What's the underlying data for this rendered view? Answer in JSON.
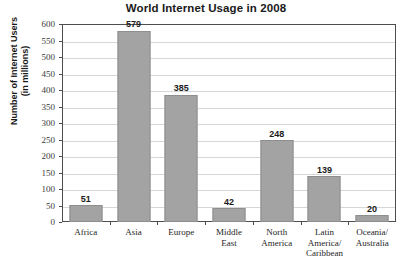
{
  "chart_data": {
    "type": "bar",
    "title": "World Internet Usage in 2008",
    "xlabel": "",
    "ylabel": "Number of Internet Users\n(in millions)",
    "ylabel_line1": "Number of Internet Users",
    "ylabel_line2": "(in millions)",
    "categories": [
      "Africa",
      "Asia",
      "Europe",
      "Middle East",
      "North America",
      "Latin America/ Caribbean",
      "Oceania/ Australia"
    ],
    "category_lines": [
      [
        "Africa"
      ],
      [
        "Asia"
      ],
      [
        "Europe"
      ],
      [
        "Middle",
        "East"
      ],
      [
        "North",
        "America"
      ],
      [
        "Latin",
        "America/",
        "Caribbean"
      ],
      [
        "Oceania/",
        "Australia"
      ]
    ],
    "values": [
      51,
      579,
      385,
      42,
      248,
      139,
      20
    ],
    "value_labels": [
      "51",
      "579",
      "385",
      "42",
      "248",
      "139",
      "20"
    ],
    "ylim": [
      0,
      600
    ],
    "ytick_step": 50,
    "ytick_labels": [
      "600",
      "550",
      "500",
      "450",
      "400",
      "350",
      "300",
      "250",
      "200",
      "150",
      "100",
      "50",
      "0"
    ],
    "ytick_values": [
      600,
      550,
      500,
      450,
      400,
      350,
      300,
      250,
      200,
      150,
      100,
      50,
      0
    ],
    "grid": true,
    "legend": false,
    "bar_color": "#a3a3a3",
    "bar_edge_color": "#8e8e8e",
    "grid_color": "#d7d7d7",
    "axis_color": "#4d4d4d",
    "text_color": "#1a1a1a",
    "background": "#ffffff"
  }
}
